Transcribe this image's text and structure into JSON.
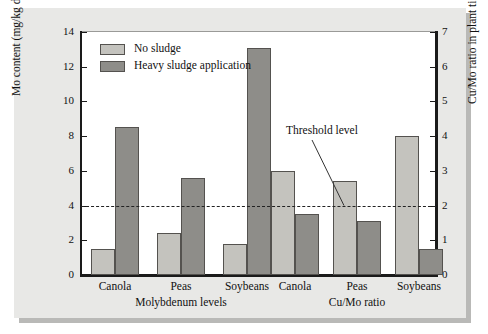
{
  "chart_data": {
    "type": "bar",
    "title": "",
    "subtitle": "",
    "grid": false,
    "legend_position": "top-left",
    "categories": [
      "Canola",
      "Peas",
      "Soybeans"
    ],
    "series": [
      {
        "name": "No sludge",
        "color": "#c4c3be"
      },
      {
        "name": "Heavy sludge application",
        "color": "#8e8d89"
      }
    ],
    "panels": [
      {
        "name": "Molybdenum levels",
        "xlabel": "Molybdenum levels",
        "ylabel": "Mo content (mg/kg dry weight)",
        "axis": "left",
        "ylim": [
          0,
          14
        ],
        "yticks": [
          0,
          2,
          4,
          6,
          8,
          10,
          12,
          14
        ],
        "categories": [
          "Canola",
          "Peas",
          "Soybeans"
        ],
        "series": [
          {
            "name": "No sludge",
            "values": [
              1.5,
              2.4,
              1.8
            ]
          },
          {
            "name": "Heavy sludge application",
            "values": [
              8.5,
              5.6,
              13.1
            ]
          }
        ]
      },
      {
        "name": "Cu/Mo ratio",
        "xlabel": "Cu/Mo ratio",
        "ylabel": "Cu/Mo ratio in plant tissue",
        "axis": "right",
        "ylim": [
          0,
          7
        ],
        "yticks": [
          0,
          1,
          2,
          3,
          4,
          5,
          6,
          7
        ],
        "categories": [
          "Canola",
          "Peas",
          "Soybeans"
        ],
        "series": [
          {
            "name": "No sludge",
            "values": [
              3.0,
              2.7,
              4.0
            ]
          },
          {
            "name": "Heavy sludge application",
            "values": [
              1.75,
              1.55,
              0.75
            ]
          }
        ]
      }
    ],
    "annotations": [
      {
        "label": "Threshold level",
        "value": 2,
        "axis": "right",
        "style": "dashed-line"
      }
    ]
  },
  "axes": {
    "left": {
      "label": "Mo content (mg/kg dry weight)",
      "ticks": [
        "0",
        "2",
        "4",
        "6",
        "8",
        "10",
        "12",
        "14"
      ]
    },
    "right": {
      "label": "Cu/Mo ratio in plant tissue",
      "ticks": [
        "0",
        "1",
        "2",
        "3",
        "4",
        "5",
        "6",
        "7"
      ]
    }
  },
  "legend": {
    "items": [
      {
        "label": "No sludge"
      },
      {
        "label": "Heavy sludge application"
      }
    ]
  },
  "annotation": {
    "threshold_label": "Threshold level"
  },
  "category_labels": {
    "left_panel": [
      "Canola",
      "Peas",
      "Soybeans"
    ],
    "right_panel": [
      "Canola",
      "Peas",
      "Soybeans"
    ]
  },
  "group_labels": {
    "left": "Molybdenum levels",
    "right": "Cu/Mo ratio"
  }
}
